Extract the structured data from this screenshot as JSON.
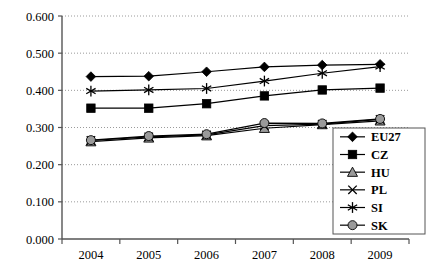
{
  "chart_data": {
    "type": "line",
    "title": "",
    "subtitle": "",
    "xlabel": "",
    "ylabel": "",
    "categories": [
      "2004",
      "2005",
      "2006",
      "2007",
      "2008",
      "2009"
    ],
    "x": [
      2004,
      2005,
      2006,
      2007,
      2008,
      2009
    ],
    "ylim": [
      0.0,
      0.6
    ],
    "ytick_labels": [
      "0.000",
      "0.100",
      "0.200",
      "0.300",
      "0.400",
      "0.500",
      "0.600"
    ],
    "ytick_values": [
      0.0,
      0.1,
      0.2,
      0.3,
      0.4,
      0.5,
      0.6
    ],
    "grid": "horizontal-dotted",
    "legend_position": "bottom-right",
    "series": [
      {
        "name": "EU27",
        "marker": "diamond",
        "marker_fill": "#000000",
        "values": [
          0.437,
          0.438,
          0.45,
          0.463,
          0.468,
          0.47
        ]
      },
      {
        "name": "CZ",
        "marker": "square",
        "marker_fill": "#000000",
        "values": [
          0.352,
          0.352,
          0.364,
          0.385,
          0.401,
          0.406
        ]
      },
      {
        "name": "HU",
        "marker": "triangle",
        "marker_fill": "#9a9a9a",
        "values": [
          0.262,
          0.272,
          0.278,
          0.298,
          0.308,
          0.318
        ]
      },
      {
        "name": "PL",
        "marker": "cross",
        "marker_fill": "#000000",
        "values": [
          0.265,
          0.275,
          0.28,
          0.305,
          0.309,
          0.322
        ]
      },
      {
        "name": "SI",
        "marker": "star",
        "marker_fill": "#000000",
        "values": [
          0.398,
          0.401,
          0.405,
          0.425,
          0.446,
          0.464
        ]
      },
      {
        "name": "SK",
        "marker": "circle",
        "marker_fill": "#9a9a9a",
        "values": [
          0.266,
          0.277,
          0.282,
          0.312,
          0.311,
          0.323
        ]
      }
    ]
  },
  "legend": {
    "items": [
      {
        "label": "EU27"
      },
      {
        "label": "CZ"
      },
      {
        "label": "HU"
      },
      {
        "label": "PL"
      },
      {
        "label": "SI"
      },
      {
        "label": "SK"
      }
    ]
  },
  "colors": {
    "line": "#000000",
    "grid": "#9a9a9a",
    "axis": "#555555",
    "gray_marker": "#9a9a9a",
    "background": "#ffffff"
  }
}
